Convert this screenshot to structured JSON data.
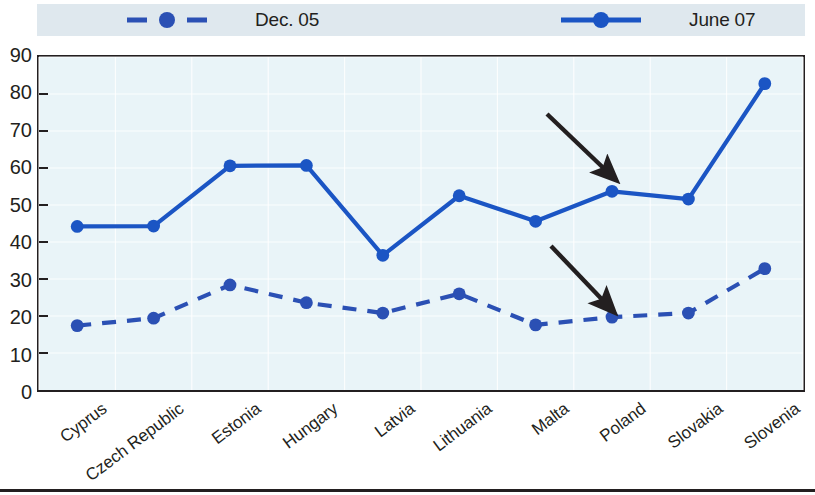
{
  "legend": {
    "entries": [
      {
        "label": "Dec. 05",
        "style": "dashed",
        "color": "#2b50b4",
        "icon": "dashed-line-marker"
      },
      {
        "label": "June 07",
        "style": "solid",
        "color": "#1b55c4",
        "icon": "solid-line-marker"
      }
    ]
  },
  "axis": {
    "y_ticks": [
      "90",
      "80",
      "70",
      "60",
      "50",
      "40",
      "30",
      "20",
      "10",
      "0"
    ]
  },
  "colors": {
    "series_blue": "#1b55c4",
    "dashed_blue": "#2b50b4",
    "plot_background": "#e9f4f8",
    "legend_background": "#dfe8ee",
    "axis_black": "#231f20",
    "arrow_black": "#231f20"
  },
  "chart_data": {
    "type": "line",
    "title": "",
    "xlabel": "",
    "ylabel": "",
    "ylim": [
      0,
      90
    ],
    "ytick_step": 10,
    "grid": true,
    "legend_position": "top",
    "categories": [
      "Cyprus",
      "Czech Republic",
      "Estonia",
      "Hungary",
      "Latvia",
      "Lithuania",
      "Malta",
      "Poland",
      "Slovakia",
      "Slovenia"
    ],
    "series": [
      {
        "name": "Dec. 05",
        "style": "dashed",
        "color": "#2b50b4",
        "values": [
          17.4,
          19.4,
          28.4,
          23.6,
          20.8,
          26.0,
          17.6,
          19.7,
          20.8,
          32.8
        ]
      },
      {
        "name": "June 07",
        "style": "solid",
        "color": "#1b55c4",
        "values": [
          44.2,
          44.3,
          60.6,
          60.7,
          36.4,
          52.5,
          45.6,
          53.7,
          51.6,
          82.8
        ]
      }
    ],
    "annotations": [
      {
        "type": "arrow",
        "points_to_series": "June 07",
        "points_to_category": "Poland",
        "from": [
          547,
          114
        ],
        "to": [
          616,
          180
        ]
      },
      {
        "type": "arrow",
        "points_to_series": "Dec. 05",
        "points_to_category": "Poland",
        "from": [
          551,
          246
        ],
        "to": [
          614,
          312
        ]
      }
    ]
  }
}
